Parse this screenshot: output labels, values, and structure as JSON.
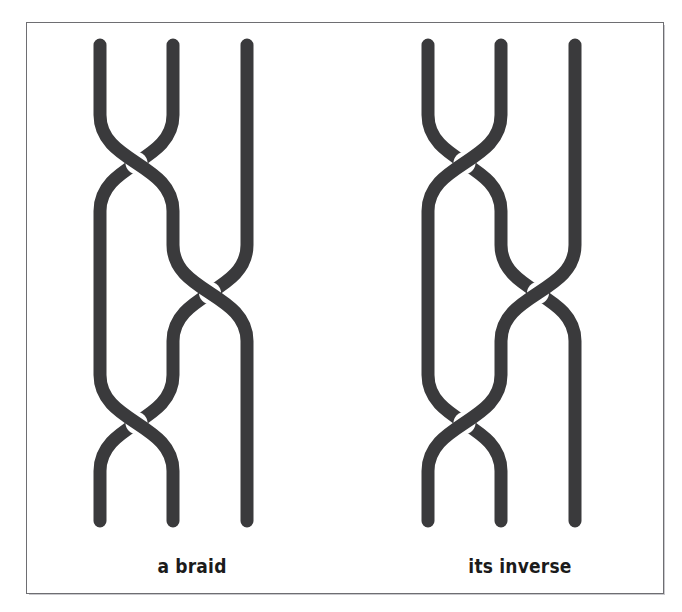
{
  "figure": {
    "background_color": "#ffffff",
    "frame_color": "#6e6e72",
    "strand_color": "#3a3a3c",
    "strand_width": 13
  },
  "panels": [
    {
      "id": "braid",
      "caption": "a braid",
      "strand_count": 3,
      "crossing_sign": "positive",
      "over_direction": "left-over-right",
      "word": "σ₁ σ₂ σ₁",
      "crossings": [
        {
          "index": 1,
          "strands": [
            1,
            2
          ],
          "center_y": 140,
          "over": "left"
        },
        {
          "index": 2,
          "strands": [
            2,
            3
          ],
          "center_y": 270,
          "over": "left"
        },
        {
          "index": 3,
          "strands": [
            1,
            2
          ],
          "center_y": 400,
          "over": "left"
        }
      ]
    },
    {
      "id": "inverse",
      "caption": "its inverse",
      "strand_count": 3,
      "crossing_sign": "negative",
      "over_direction": "right-over-left",
      "word": "σ₁⁻¹ σ₂⁻¹ σ₁⁻¹",
      "crossings": [
        {
          "index": 1,
          "strands": [
            1,
            2
          ],
          "center_y": 140,
          "over": "right"
        },
        {
          "index": 2,
          "strands": [
            2,
            3
          ],
          "center_y": 270,
          "over": "right"
        },
        {
          "index": 3,
          "strands": [
            1,
            2
          ],
          "center_y": 400,
          "over": "right"
        }
      ]
    }
  ],
  "geometry": {
    "lane_x": [
      33,
      106,
      180
    ],
    "top_y": 22,
    "bottom_y": 498,
    "crossing_half_height": 48,
    "gap_radius": 11
  }
}
